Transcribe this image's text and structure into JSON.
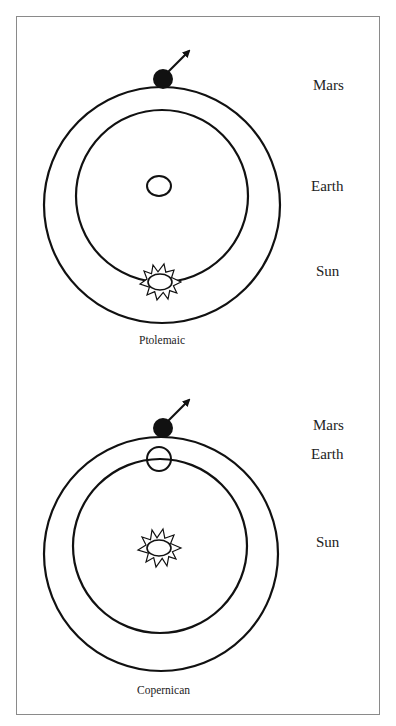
{
  "colors": {
    "stroke": "#111111",
    "frame": "#8a8a8a",
    "text": "#222222",
    "background": "#ffffff"
  },
  "panels": [
    {
      "caption": "Ptolemaic",
      "labels": {
        "mars": "Mars",
        "earth": "Earth",
        "sun": "Sun"
      },
      "description": "Earth at center; Sun orbits on inner circle; Mars on outer circle with motion arrow"
    },
    {
      "caption": "Copernican",
      "labels": {
        "mars": "Mars",
        "earth": "Earth",
        "sun": "Sun"
      },
      "description": "Sun at center; Earth orbits on inner circle; Mars on outer circle with motion arrow"
    }
  ]
}
